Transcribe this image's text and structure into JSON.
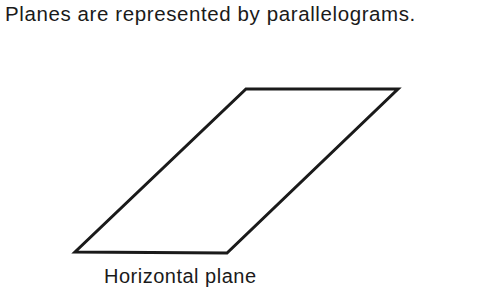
{
  "title": "Planes are represented by parallelograms.",
  "figure": {
    "shape": "parallelogram",
    "vertices": [
      [
        246,
        89
      ],
      [
        398,
        89
      ],
      [
        227,
        253
      ],
      [
        75,
        252
      ]
    ],
    "stroke_color": "#1a1a1a",
    "caption": "Horizontal plane"
  }
}
